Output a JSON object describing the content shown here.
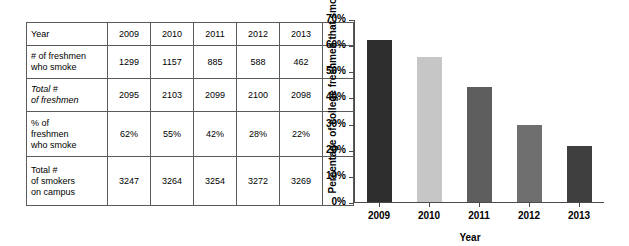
{
  "table": {
    "columns": [
      "Year",
      "2009",
      "2010",
      "2011",
      "2012",
      "2013",
      ""
    ],
    "rows": [
      {
        "label": "Year",
        "italic": false,
        "values": [
          "2009",
          "2010",
          "2011",
          "2012",
          "2013"
        ],
        "spacer": ""
      },
      {
        "label": "# of freshmen\nwho smoke",
        "italic": false,
        "values": [
          "1299",
          "1157",
          "885",
          "588",
          "462"
        ],
        "spacer": ""
      },
      {
        "label": "Total #\nof freshmen",
        "italic": true,
        "values": [
          "2095",
          "2103",
          "2099",
          "2100",
          "2098"
        ],
        "spacer": ""
      },
      {
        "label": "% of\nfreshmen\nwho smoke",
        "italic": false,
        "values": [
          "62%",
          "55%",
          "42%",
          "28%",
          "22%"
        ],
        "spacer": ""
      },
      {
        "label": "Total #\nof smokers\non campus",
        "italic": false,
        "values": [
          "3247",
          "3264",
          "3254",
          "3272",
          "3269"
        ],
        "spacer": ""
      }
    ]
  },
  "chart_data": {
    "type": "bar",
    "title": "",
    "xlabel": "Year",
    "ylabel": "Percentage of college freshmen that smoke",
    "categories": [
      "2009",
      "2010",
      "2011",
      "2012",
      "2013"
    ],
    "values": [
      62,
      55.5,
      44,
      29.5,
      21.5
    ],
    "value_labels": [
      "62%",
      "55.5%",
      "44%",
      "29.5%",
      "21.5%"
    ],
    "bar_colors": [
      "#2e2e2e",
      "#c6c6c6",
      "#5e5e5e",
      "#6f6f6f",
      "#3f3f3f"
    ],
    "ylim": [
      0,
      70
    ],
    "ytick_values": [
      0,
      10,
      20,
      30,
      40,
      50,
      60,
      70
    ],
    "ytick_labels": [
      "0%",
      "10%",
      "20%",
      "30%",
      "40%",
      "50%",
      "60%",
      "70%"
    ],
    "grid": false,
    "legend": false,
    "axis_color": "#4a4a4a"
  }
}
